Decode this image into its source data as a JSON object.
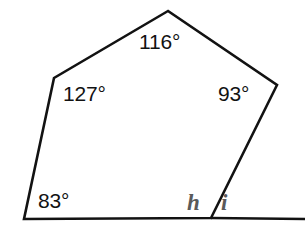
{
  "figure": {
    "background_color": "#ffffff",
    "stroke_color": "#121212",
    "label_color": "#121212",
    "variable_label_color": "#5a5a5a",
    "polygon": {
      "name": "pentagon",
      "vertices": [
        {
          "name": "apex",
          "x": 168,
          "y": 11
        },
        {
          "name": "upper-left",
          "x": 54,
          "y": 78
        },
        {
          "name": "bottom-left",
          "x": 24,
          "y": 219
        },
        {
          "name": "bottom-right",
          "x": 211,
          "y": 218
        },
        {
          "name": "upper-right",
          "x": 277,
          "y": 85
        }
      ],
      "points_attr": "168,11 54,78 24,219 211,218 277,85"
    },
    "extension_line": {
      "name": "base-extension",
      "x1": 211,
      "y1": 218,
      "x2": 305,
      "y2": 219
    },
    "labels": [
      {
        "id": "angle-top",
        "text": "116°",
        "x": 139,
        "y": 31,
        "kind": "angle"
      },
      {
        "id": "angle-left",
        "text": "127°",
        "x": 63,
        "y": 83,
        "kind": "angle"
      },
      {
        "id": "angle-right",
        "text": "93°",
        "x": 218,
        "y": 83,
        "kind": "angle"
      },
      {
        "id": "angle-bottom-left",
        "text": "83°",
        "x": 38,
        "y": 190,
        "kind": "angle"
      },
      {
        "id": "var-h",
        "text": "h",
        "x": 187,
        "y": 191,
        "kind": "variable"
      },
      {
        "id": "var-i",
        "text": "i",
        "x": 221,
        "y": 191,
        "kind": "variable"
      }
    ]
  }
}
